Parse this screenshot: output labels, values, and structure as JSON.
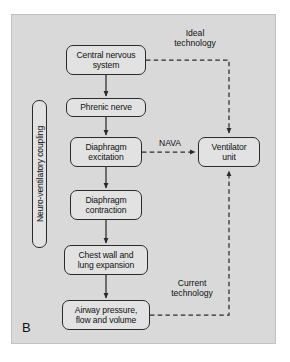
{
  "figure": {
    "panel_letter": "B",
    "background_color": "#d9d9d9",
    "node_fill_color": "#e2e2e2",
    "line_color": "#2b2b2b"
  },
  "diagram": {
    "type": "flowchart",
    "nodes": [
      {
        "id": "cns",
        "label": "Central nervous\nsystem",
        "x": 66,
        "y": 45,
        "w": 80,
        "h": 30
      },
      {
        "id": "phrenic",
        "label": "Phrenic nerve",
        "x": 66,
        "y": 98,
        "w": 80,
        "h": 19
      },
      {
        "id": "excitation",
        "label": "Diaphragm\nexcitation",
        "x": 70,
        "y": 137,
        "w": 72,
        "h": 30
      },
      {
        "id": "contraction",
        "label": "Diaphragm\ncontraction",
        "x": 70,
        "y": 190,
        "w": 72,
        "h": 30
      },
      {
        "id": "chestwall",
        "label": "Chest wall and\nlung expansion",
        "x": 64,
        "y": 245,
        "w": 84,
        "h": 30
      },
      {
        "id": "airway",
        "label": "Airway pressure,\nflow and volume",
        "x": 62,
        "y": 300,
        "w": 88,
        "h": 30
      },
      {
        "id": "ventilator",
        "label": "Ventilator\nunit",
        "x": 198,
        "y": 137,
        "w": 62,
        "h": 30
      }
    ],
    "bracket": {
      "id": "coupling",
      "label": "Neuro-ventilatory coupling",
      "orientation": "vertical"
    },
    "edge_labels": [
      {
        "id": "ideal",
        "label": "Ideal\ntechnology",
        "x": 158,
        "y": 28,
        "w": 74
      },
      {
        "id": "nava",
        "label": "NAVA",
        "x": 148,
        "y": 138,
        "w": 44
      },
      {
        "id": "current",
        "label": "Current\ntechnology",
        "x": 155,
        "y": 278,
        "w": 74
      }
    ],
    "edges": [
      {
        "from": "cns",
        "to": "phrenic",
        "style": "solid",
        "arrow": true
      },
      {
        "from": "phrenic",
        "to": "excitation",
        "style": "solid",
        "arrow": true
      },
      {
        "from": "excitation",
        "to": "contraction",
        "style": "solid",
        "arrow": true
      },
      {
        "from": "contraction",
        "to": "chestwall",
        "style": "solid",
        "arrow": true
      },
      {
        "from": "chestwall",
        "to": "airway",
        "style": "solid",
        "arrow": true
      },
      {
        "from": "cns",
        "to": "ventilator",
        "style": "dashed",
        "arrow": true,
        "label": "Ideal technology"
      },
      {
        "from": "excitation",
        "to": "ventilator",
        "style": "dashed",
        "arrow": true,
        "label": "NAVA"
      },
      {
        "from": "airway",
        "to": "ventilator",
        "style": "dashed",
        "arrow": true,
        "label": "Current technology"
      }
    ]
  }
}
